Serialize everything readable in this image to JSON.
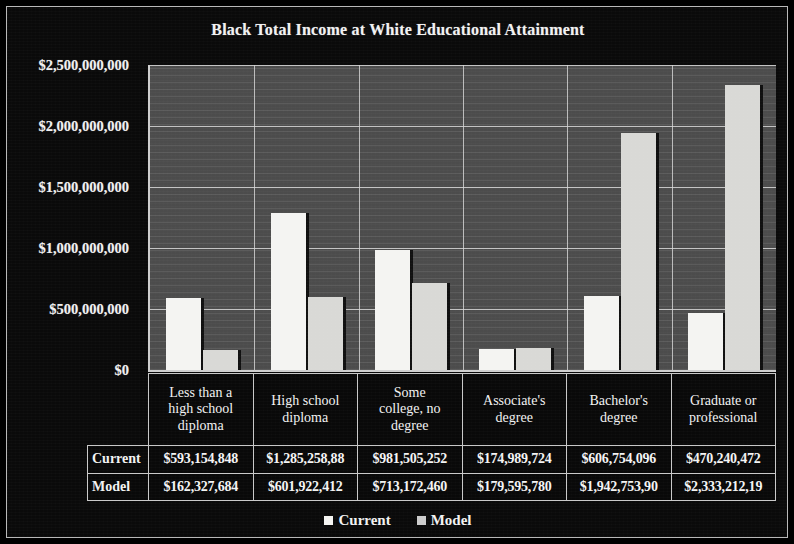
{
  "chart_data": {
    "type": "bar",
    "title": "Black Total Income at White Educational Attainment",
    "xlabel": "",
    "ylabel": "",
    "ylim": [
      0,
      2500000000
    ],
    "grid": true,
    "legend_position": "bottom",
    "categories": [
      "Less than a high school diploma",
      "High school diploma",
      "Some college, no degree",
      "Associate's degree",
      "Bachelor's degree",
      "Graduate or professional"
    ],
    "series": [
      {
        "name": "Current",
        "values": [
          593154848,
          1285258880,
          981505252,
          174989724,
          606754096,
          470240472
        ]
      },
      {
        "name": "Model",
        "values": [
          162327684,
          601922412,
          713172460,
          179595780,
          1942753900,
          2333212190
        ]
      }
    ],
    "ytick_labels": [
      "$2,500,000,000",
      "$2,000,000,000",
      "$1,500,000,000",
      "$1,000,000,000",
      "$500,000,000",
      "$0"
    ],
    "ytick_values": [
      2500000000,
      2000000000,
      1500000000,
      1000000000,
      500000000,
      0
    ],
    "colors": {
      "current": "#f4f4f2",
      "model": "#d9d9d6",
      "plot_background": "#4c4c4c",
      "figure_background": "#0a0a0a",
      "text": "#f2f2f2",
      "gridline": "#d8d8d8"
    }
  },
  "category_labels": [
    [
      "Less than a",
      "high school",
      "diploma"
    ],
    [
      "High school",
      "diploma"
    ],
    [
      "Some",
      "college, no",
      "degree"
    ],
    [
      "Associate's",
      "degree"
    ],
    [
      "Bachelor's",
      "degree"
    ],
    [
      "Graduate or",
      "professional"
    ]
  ],
  "table": {
    "rows": [
      {
        "label": "Current",
        "cells": [
          "$593,154,848",
          "$1,285,258,88",
          "$981,505,252",
          "$174,989,724",
          "$606,754,096",
          "$470,240,472"
        ]
      },
      {
        "label": "Model",
        "cells": [
          "$162,327,684",
          "$601,922,412",
          "$713,172,460",
          "$179,595,780",
          "$1,942,753,90",
          "$2,333,212,19"
        ]
      }
    ]
  },
  "legend": {
    "items": [
      {
        "label": "Current"
      },
      {
        "label": "Model"
      }
    ]
  }
}
